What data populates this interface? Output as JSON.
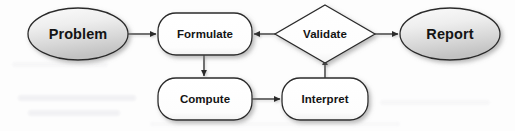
{
  "diagram": {
    "type": "flowchart",
    "canvas": {
      "width": 515,
      "height": 131,
      "background": "#fdfdfd"
    },
    "style": {
      "terminal_fill_light": "#f4f4f4",
      "terminal_fill_dark": "#c9c9c9",
      "process_fill": "#ffffff",
      "decision_fill": "#ffffff",
      "stroke": "#2b2b2b",
      "shadow": "#b8b8b8",
      "text": "#141414"
    },
    "nodes": [
      {
        "id": "problem",
        "label": "Problem",
        "shape": "ellipse",
        "cx": 78,
        "cy": 34,
        "rx": 50,
        "ry": 26
      },
      {
        "id": "formulate",
        "label": "Formulate",
        "shape": "rounded-rect",
        "x": 158,
        "y": 13,
        "w": 94,
        "h": 42
      },
      {
        "id": "validate",
        "label": "Validate",
        "shape": "diamond",
        "cx": 325,
        "cy": 34,
        "hw": 50,
        "hh": 29
      },
      {
        "id": "report",
        "label": "Report",
        "shape": "ellipse",
        "cx": 450,
        "cy": 34,
        "rx": 50,
        "ry": 26
      },
      {
        "id": "compute",
        "label": "Compute",
        "shape": "rounded-rect",
        "x": 158,
        "y": 78,
        "w": 94,
        "h": 42
      },
      {
        "id": "interpret",
        "label": "Interpret",
        "shape": "rounded-rect",
        "x": 282,
        "y": 78,
        "w": 86,
        "h": 42
      }
    ],
    "edges": [
      {
        "id": "problem-to-formulate",
        "from": "problem",
        "to": "formulate",
        "direction": "right"
      },
      {
        "id": "formulate-to-compute",
        "from": "formulate",
        "to": "compute",
        "direction": "down"
      },
      {
        "id": "compute-to-interpret",
        "from": "compute",
        "to": "interpret",
        "direction": "right"
      },
      {
        "id": "interpret-to-validate",
        "from": "interpret",
        "to": "validate",
        "direction": "up"
      },
      {
        "id": "validate-to-formulate",
        "from": "validate",
        "to": "formulate",
        "direction": "left"
      },
      {
        "id": "validate-to-report",
        "from": "validate",
        "to": "report",
        "direction": "right"
      }
    ]
  }
}
